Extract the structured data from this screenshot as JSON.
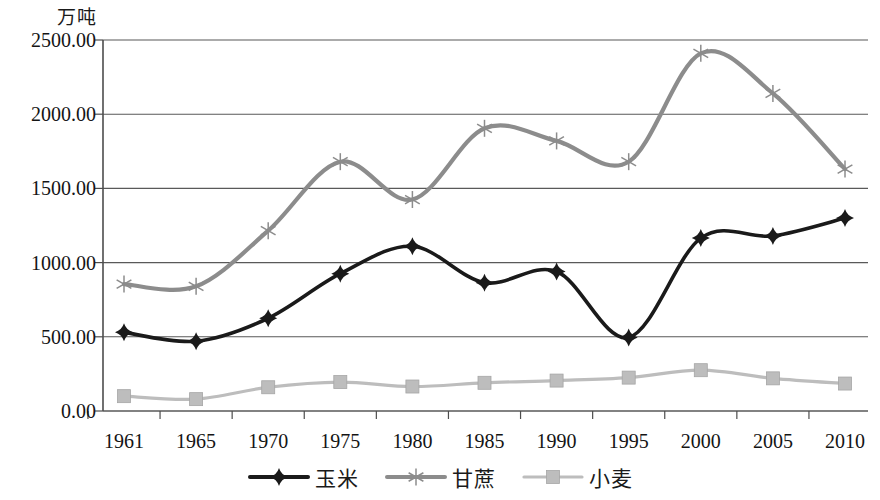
{
  "chart_data": {
    "type": "line",
    "title": "",
    "subtitle": "",
    "ylabel": "万吨",
    "xlabel": "",
    "categories": [
      "1961",
      "1965",
      "1970",
      "1975",
      "1980",
      "1985",
      "1990",
      "1995",
      "2000",
      "2005",
      "2010"
    ],
    "ylim": [
      0,
      2500
    ],
    "yticks": [
      "0.00",
      "500.00",
      "1000.00",
      "1500.00",
      "2000.00",
      "2500.00"
    ],
    "ytick_values": [
      0,
      500,
      1000,
      1500,
      2000,
      2500
    ],
    "grid": true,
    "legend_position": "bottom",
    "series": [
      {
        "name": "玉米",
        "marker": "diamond",
        "color": "#1a1a1a",
        "values": [
          530,
          470,
          625,
          925,
          1110,
          865,
          940,
          495,
          1165,
          1180,
          1300
        ]
      },
      {
        "name": "甘蔗",
        "marker": "asterisk",
        "color": "#8c8c8c",
        "values": [
          855,
          840,
          1215,
          1680,
          1425,
          1905,
          1820,
          1680,
          2410,
          2140,
          1630
        ]
      },
      {
        "name": "小麦",
        "marker": "square",
        "color": "#bdbdbd",
        "values": [
          100,
          80,
          160,
          195,
          165,
          190,
          205,
          225,
          275,
          220,
          185
        ]
      }
    ]
  },
  "legend": {
    "items": [
      {
        "label": "玉米",
        "marker": "diamond",
        "color": "#1a1a1a"
      },
      {
        "label": "甘蔗",
        "marker": "asterisk",
        "color": "#8c8c8c"
      },
      {
        "label": "小麦",
        "marker": "square",
        "color": "#bdbdbd"
      }
    ]
  },
  "axis": {
    "y_unit_label": "万吨"
  }
}
